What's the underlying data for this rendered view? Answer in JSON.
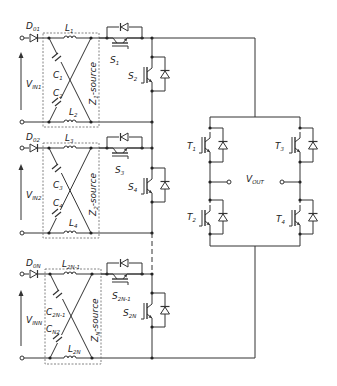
{
  "diagram": {
    "type": "circuit-schematic",
    "colors": {
      "wire": "#333333",
      "box": "#666666",
      "background": "#ffffff"
    },
    "modules": [
      {
        "diode": {
          "main": "D",
          "sub": "01"
        },
        "inductor_top": {
          "main": "L",
          "sub": "1"
        },
        "inductor_bottom": {
          "main": "L",
          "sub": "2"
        },
        "cap_top": {
          "main": "C",
          "sub": "1"
        },
        "cap_bottom": {
          "main": "C",
          "sub": "2"
        },
        "source_label": {
          "main": "Z",
          "sub": "1",
          "rest": "-source"
        },
        "input_voltage": {
          "main": "V",
          "sub": "IN1"
        },
        "switch_top": {
          "main": "S",
          "sub": "1"
        },
        "switch_bottom": {
          "main": "S",
          "sub": "2"
        }
      },
      {
        "diode": {
          "main": "D",
          "sub": "02"
        },
        "inductor_top": {
          "main": "L",
          "sub": "3"
        },
        "inductor_bottom": {
          "main": "L",
          "sub": "4"
        },
        "cap_top": {
          "main": "C",
          "sub": "3"
        },
        "cap_bottom": {
          "main": "C",
          "sub": "4"
        },
        "source_label": {
          "main": "Z",
          "sub": "2",
          "rest": "-source"
        },
        "input_voltage": {
          "main": "V",
          "sub": "IN2"
        },
        "switch_top": {
          "main": "S",
          "sub": "3"
        },
        "switch_bottom": {
          "main": "S",
          "sub": "4"
        }
      },
      {
        "diode": {
          "main": "D",
          "sub": "0N"
        },
        "inductor_top": {
          "main": "L",
          "sub": "2N-1"
        },
        "inductor_bottom": {
          "main": "L",
          "sub": "2N"
        },
        "cap_top": {
          "main": "C",
          "sub": "2N-1"
        },
        "cap_bottom": {
          "main": "C",
          "sub": "N2"
        },
        "source_label": {
          "main": "Z",
          "sub": "N",
          "rest": "-source"
        },
        "input_voltage": {
          "main": "V",
          "sub": "INN"
        },
        "switch_top": {
          "main": "S",
          "sub": "2N-1"
        },
        "switch_bottom": {
          "main": "S",
          "sub": "2N"
        }
      }
    ],
    "h_bridge": {
      "t1": {
        "main": "T",
        "sub": "1"
      },
      "t2": {
        "main": "T",
        "sub": "2"
      },
      "t3": {
        "main": "T",
        "sub": "3"
      },
      "t4": {
        "main": "T",
        "sub": "4"
      },
      "output": {
        "main": "V",
        "sub": "OUT"
      }
    }
  }
}
